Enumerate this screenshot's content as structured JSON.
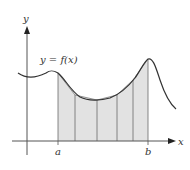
{
  "diagram": {
    "curve_label": "y = f(x)",
    "axes": {
      "x_label": "x",
      "y_label": "y"
    },
    "interval": {
      "a_label": "a",
      "b_label": "b"
    },
    "subintervals": 6,
    "colors": {
      "background": "#ffffff",
      "fill": "#e2e2e2",
      "curve": "#333333",
      "axis": "#555555",
      "strip_lines": "#6a6a6a"
    }
  }
}
